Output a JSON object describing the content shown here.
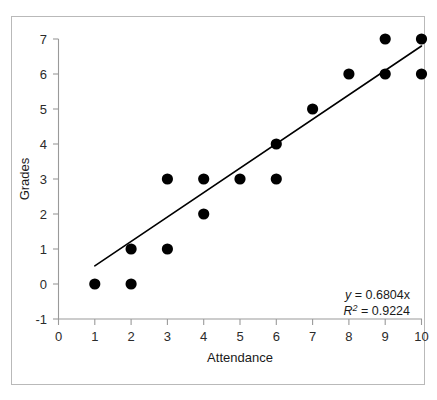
{
  "chart_data": {
    "type": "scatter",
    "title": "",
    "xlabel": "Attendance",
    "ylabel": "Grades",
    "xlim": [
      0,
      10
    ],
    "ylim": [
      -1,
      7
    ],
    "xticks": [
      "0",
      "1",
      "2",
      "3",
      "4",
      "5",
      "6",
      "7",
      "8",
      "9",
      "10"
    ],
    "yticks": [
      "-1",
      "0",
      "1",
      "2",
      "3",
      "4",
      "5",
      "6",
      "7"
    ],
    "xtick_values": [
      0,
      1,
      2,
      3,
      4,
      5,
      6,
      7,
      8,
      9,
      10
    ],
    "ytick_values": [
      -1,
      0,
      1,
      2,
      3,
      4,
      5,
      6,
      7
    ],
    "grid": false,
    "legend": null,
    "marker_color": "#000000",
    "marker_shape": "circle",
    "trendline_color": "#000000",
    "points": [
      {
        "x": 1,
        "y": 0
      },
      {
        "x": 2,
        "y": 0
      },
      {
        "x": 2,
        "y": 1
      },
      {
        "x": 3,
        "y": 1
      },
      {
        "x": 3,
        "y": 3
      },
      {
        "x": 4,
        "y": 2
      },
      {
        "x": 4,
        "y": 3
      },
      {
        "x": 5,
        "y": 3
      },
      {
        "x": 6,
        "y": 3
      },
      {
        "x": 6,
        "y": 4
      },
      {
        "x": 7,
        "y": 5
      },
      {
        "x": 8,
        "y": 6
      },
      {
        "x": 9,
        "y": 6
      },
      {
        "x": 9,
        "y": 7
      },
      {
        "x": 10,
        "y": 6
      },
      {
        "x": 10,
        "y": 7
      }
    ],
    "trendline": {
      "slope": 0.6804,
      "intercept": 0,
      "x_start": 1.0,
      "y_start": 0.52,
      "x_end": 10.0,
      "y_end": 6.8
    },
    "annotations": {
      "equation_var": "y",
      "equation_rest": " = 0.6804x",
      "r2_var": "R",
      "r2_sup": "2",
      "r2_rest": " = 0.9224"
    }
  }
}
